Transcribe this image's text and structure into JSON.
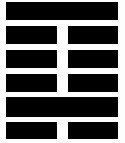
{
  "figure": {
    "kind": "iching-hexagram",
    "width_px": 125,
    "height_px": 143,
    "background_color": "#fdfdfd",
    "line_color": "#000000",
    "line_count": 6,
    "reading_order": "top-to-bottom",
    "left_margin_px": 6,
    "right_margin_px": 7,
    "center_gap_px": 11
  },
  "chart_data": {
    "type": "bar",
    "title": "",
    "xlabel": "",
    "ylabel": "",
    "grid": false,
    "legend": null,
    "categories": [
      "line-1-top",
      "line-2",
      "line-3",
      "line-4",
      "line-5",
      "line-6-bottom"
    ],
    "values": [
      1,
      0,
      0,
      0,
      1,
      0
    ],
    "series": [
      {
        "name": "line-type",
        "values": [
          "solid",
          "broken",
          "broken",
          "broken",
          "solid",
          "broken"
        ]
      },
      {
        "name": "yin-yang",
        "values": [
          "yang",
          "yin",
          "yin",
          "yin",
          "yang",
          "yin"
        ]
      }
    ],
    "annotations": []
  },
  "lines": [
    {
      "index": 1,
      "position": "top",
      "type": "solid",
      "polarity": "yang",
      "top_px": 2,
      "height_px": 18
    },
    {
      "index": 2,
      "position": "second",
      "type": "broken",
      "polarity": "yin",
      "top_px": 26,
      "height_px": 18
    },
    {
      "index": 3,
      "position": "third",
      "type": "broken",
      "polarity": "yin",
      "top_px": 50,
      "height_px": 18
    },
    {
      "index": 4,
      "position": "fourth",
      "type": "broken",
      "polarity": "yin",
      "top_px": 74,
      "height_px": 18
    },
    {
      "index": 5,
      "position": "fifth",
      "type": "solid",
      "polarity": "yang",
      "top_px": 97,
      "height_px": 20
    },
    {
      "index": 6,
      "position": "bottom",
      "type": "broken",
      "polarity": "yin",
      "top_px": 122,
      "height_px": 17
    }
  ]
}
